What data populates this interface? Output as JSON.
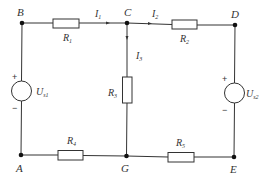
{
  "diagram": {
    "type": "circuit",
    "nodes": {
      "B": {
        "label": "B"
      },
      "C": {
        "label": "C"
      },
      "D": {
        "label": "D"
      },
      "A": {
        "label": "A"
      },
      "G": {
        "label": "G"
      },
      "E": {
        "label": "E"
      }
    },
    "resistors": [
      {
        "id": "R1",
        "label": "R",
        "sub": "1",
        "between": [
          "B",
          "C"
        ]
      },
      {
        "id": "R2",
        "label": "R",
        "sub": "2",
        "between": [
          "C",
          "D"
        ]
      },
      {
        "id": "R3",
        "label": "R",
        "sub": "3",
        "between": [
          "C",
          "G"
        ]
      },
      {
        "id": "R4",
        "label": "R",
        "sub": "4",
        "between": [
          "A",
          "G"
        ]
      },
      {
        "id": "R5",
        "label": "R",
        "sub": "5",
        "between": [
          "G",
          "E"
        ]
      }
    ],
    "sources": [
      {
        "id": "Us1",
        "label": "U",
        "sub": "s1",
        "plus": "+",
        "minus": "−",
        "between": [
          "B",
          "A"
        ]
      },
      {
        "id": "Us2",
        "label": "U",
        "sub": "s2",
        "plus": "+",
        "minus": "−",
        "between": [
          "D",
          "E"
        ]
      }
    ],
    "currents": [
      {
        "id": "I1",
        "label": "I",
        "sub": "1",
        "branch": "B-C"
      },
      {
        "id": "I2",
        "label": "I",
        "sub": "2",
        "branch": "C-D"
      },
      {
        "id": "I3",
        "label": "I",
        "sub": "3",
        "branch": "C-G"
      }
    ]
  }
}
